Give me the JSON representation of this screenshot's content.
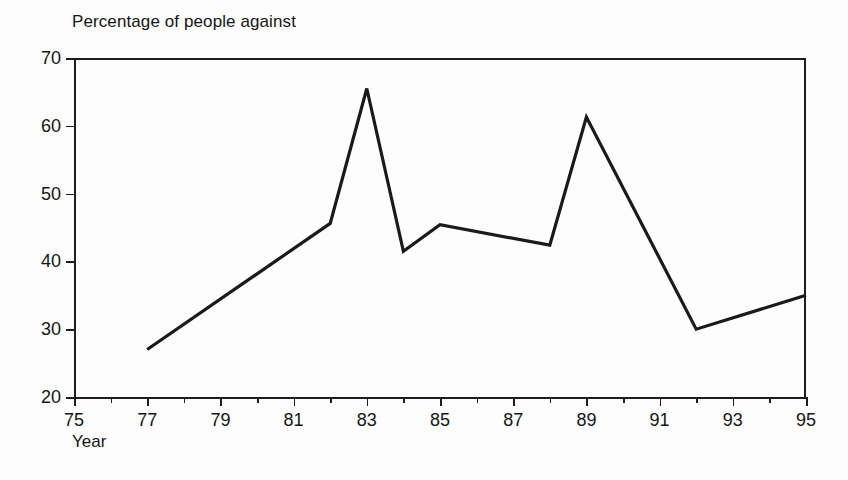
{
  "chart_data": {
    "type": "line",
    "title": "Percentage of people against",
    "xlabel": "Year",
    "ylabel": "",
    "xlim": [
      75,
      95
    ],
    "ylim": [
      20,
      70
    ],
    "grid": false,
    "legend": null,
    "x_ticks": [
      75,
      77,
      79,
      81,
      83,
      85,
      87,
      89,
      91,
      93,
      95
    ],
    "x_tick_labels": [
      "75",
      "77",
      "79",
      "81",
      "83",
      "85",
      "87",
      "89",
      "91",
      "93",
      "95"
    ],
    "x_minor_ticks": [
      76,
      78,
      80,
      82,
      84,
      86,
      88,
      90,
      92,
      94
    ],
    "y_ticks": [
      20,
      30,
      40,
      50,
      60,
      70
    ],
    "y_tick_labels": [
      "20",
      "30",
      "40",
      "50",
      "60",
      "70"
    ],
    "series": [
      {
        "name": "Percentage of people against",
        "color": "#1a1a1a",
        "x": [
          77,
          82,
          83,
          84,
          85,
          88,
          89,
          92,
          95
        ],
        "values": [
          27,
          45.6,
          65.5,
          41.5,
          45.4,
          42.4,
          61.3,
          30,
          35
        ]
      }
    ]
  },
  "axes": {
    "y_labels": [
      "70",
      "60",
      "50",
      "40",
      "30",
      "20"
    ],
    "x_labels": [
      "75",
      "77",
      "79",
      "81",
      "83",
      "85",
      "87",
      "89",
      "91",
      "93",
      "95"
    ]
  },
  "labels": {
    "title": "Percentage of people against",
    "x_axis_title": "Year"
  },
  "colors": {
    "line": "#1a1a1a",
    "axis": "#1d1d1d",
    "background": "#fdfdfd",
    "text": "#151515"
  }
}
